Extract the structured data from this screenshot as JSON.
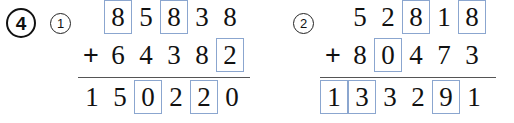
{
  "page": {
    "exercise_number": "4",
    "background_color": "#ffffff",
    "box_border_color": "#8ba6cf",
    "rule_color": "#555555",
    "text_color": "#111111"
  },
  "problems": [
    {
      "label": "1",
      "operator": "+",
      "addend1": {
        "digits": [
          "8",
          "5",
          "8",
          "3",
          "8"
        ],
        "boxed": [
          true,
          false,
          true,
          false,
          false
        ]
      },
      "addend2": {
        "digits": [
          "6",
          "4",
          "3",
          "8",
          "2"
        ],
        "boxed": [
          false,
          false,
          false,
          false,
          true
        ]
      },
      "sum": {
        "digits": [
          "1",
          "5",
          "0",
          "2",
          "2",
          "0"
        ],
        "boxed": [
          false,
          false,
          true,
          false,
          true,
          false
        ]
      }
    },
    {
      "label": "2",
      "operator": "+",
      "addend1": {
        "digits": [
          "5",
          "2",
          "8",
          "1",
          "8"
        ],
        "boxed": [
          false,
          false,
          true,
          false,
          true
        ]
      },
      "addend2": {
        "digits": [
          "8",
          "0",
          "4",
          "7",
          "3"
        ],
        "boxed": [
          false,
          true,
          false,
          false,
          false
        ]
      },
      "sum": {
        "digits": [
          "1",
          "3",
          "3",
          "2",
          "9",
          "1"
        ],
        "boxed": [
          true,
          true,
          false,
          false,
          true,
          false
        ]
      }
    }
  ]
}
